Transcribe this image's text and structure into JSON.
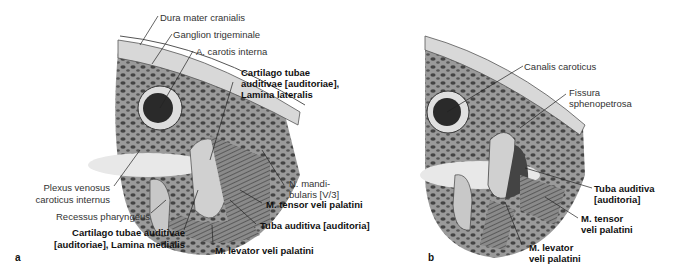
{
  "figure": {
    "panel_a": {
      "letter": "a",
      "labels": {
        "dura_mater": "Dura mater cranialis",
        "ganglion": "Ganglion trigeminale",
        "carotis": "A. carotis interna",
        "cart_lat_1": "Cartilago tubae",
        "cart_lat_2": "auditivae [auditoriae],",
        "cart_lat_3": "Lamina lateralis",
        "plexus_1": "Plexus venosus",
        "plexus_2": "caroticus internus",
        "n_mand_1": "N. mandi-",
        "n_mand_2": "bularis [V/3]",
        "recessus": "Recessus pharyngeus",
        "tensor": "M. tensor veli palatini",
        "tuba": "Tuba auditiva [auditoria]",
        "cart_med_1": "Cartilago tubae auditivae",
        "cart_med_2": "[auditoriae], Lamina medialis",
        "levator": "M. levator veli palatini"
      }
    },
    "panel_b": {
      "letter": "b",
      "labels": {
        "canalis": "Canalis caroticus",
        "fissura_1": "Fissura",
        "fissura_2": "sphenopetrosa",
        "tuba_1": "Tuba auditiva",
        "tuba_2": "[auditoria]",
        "tensor_1": "M. tensor",
        "tensor_2": "veli palatini",
        "levator_1": "M. levator",
        "levator_2": "veli palatini"
      }
    }
  }
}
